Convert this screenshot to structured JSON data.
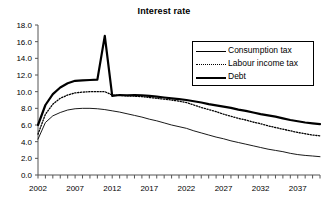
{
  "chart_data": {
    "type": "line",
    "title": "Interest rate",
    "xlabel": "",
    "ylabel": "",
    "grid": false,
    "legend_position": "top-right",
    "xlim": [
      2002,
      2040
    ],
    "ylim": [
      0.0,
      18.0
    ],
    "ytick_step": 2.0,
    "yticks": [
      "0.0",
      "2.0",
      "4.0",
      "6.0",
      "8.0",
      "10.0",
      "12.0",
      "14.0",
      "16.0",
      "18.0"
    ],
    "xticks": [
      "2002",
      "2007",
      "2012",
      "2017",
      "2022",
      "2027",
      "2032",
      "2037"
    ],
    "xtick_interval_minor": 1,
    "x": [
      2002,
      2003,
      2004,
      2005,
      2006,
      2007,
      2008,
      2009,
      2010,
      2011,
      2012,
      2013,
      2014,
      2015,
      2016,
      2017,
      2018,
      2019,
      2020,
      2021,
      2022,
      2023,
      2024,
      2025,
      2026,
      2027,
      2028,
      2029,
      2030,
      2031,
      2032,
      2033,
      2034,
      2035,
      2036,
      2037,
      2038,
      2039,
      2040
    ],
    "series": [
      {
        "name": "Consumption tax",
        "style": "thin-solid",
        "color": "#000000",
        "values": [
          4.3,
          6.3,
          7.1,
          7.5,
          7.8,
          7.95,
          8.0,
          8.0,
          7.95,
          7.85,
          7.7,
          7.55,
          7.35,
          7.15,
          6.95,
          6.7,
          6.5,
          6.25,
          6.0,
          5.8,
          5.6,
          5.3,
          5.05,
          4.8,
          4.55,
          4.35,
          4.1,
          3.9,
          3.7,
          3.5,
          3.3,
          3.1,
          2.95,
          2.8,
          2.6,
          2.45,
          2.35,
          2.28,
          2.2
        ]
      },
      {
        "name": "Labour income tax",
        "style": "dotted",
        "color": "#000000",
        "values": [
          4.9,
          7.3,
          8.5,
          9.2,
          9.6,
          9.85,
          9.95,
          10.0,
          10.0,
          10.0,
          9.6,
          9.55,
          9.5,
          9.45,
          9.4,
          9.3,
          9.2,
          9.1,
          9.0,
          8.85,
          8.7,
          8.4,
          8.1,
          7.85,
          7.6,
          7.3,
          7.05,
          6.8,
          6.6,
          6.35,
          6.15,
          5.9,
          5.7,
          5.5,
          5.3,
          5.1,
          4.95,
          4.8,
          4.7
        ]
      },
      {
        "name": "Debt",
        "style": "thick-solid",
        "color": "#000000",
        "values": [
          6.0,
          8.4,
          9.7,
          10.5,
          11.0,
          11.3,
          11.35,
          11.4,
          11.45,
          16.7,
          9.5,
          9.6,
          9.55,
          9.6,
          9.55,
          9.5,
          9.4,
          9.3,
          9.2,
          9.1,
          9.0,
          8.85,
          8.7,
          8.5,
          8.35,
          8.2,
          8.05,
          7.85,
          7.7,
          7.5,
          7.3,
          7.15,
          7.0,
          6.8,
          6.6,
          6.45,
          6.3,
          6.2,
          6.1
        ]
      }
    ],
    "annotations": []
  },
  "legend": {
    "items": [
      {
        "label": "Consumption tax",
        "style": "thin-solid"
      },
      {
        "label": "Labour income tax",
        "style": "dotted"
      },
      {
        "label": "Debt",
        "style": "thick-solid"
      }
    ]
  }
}
